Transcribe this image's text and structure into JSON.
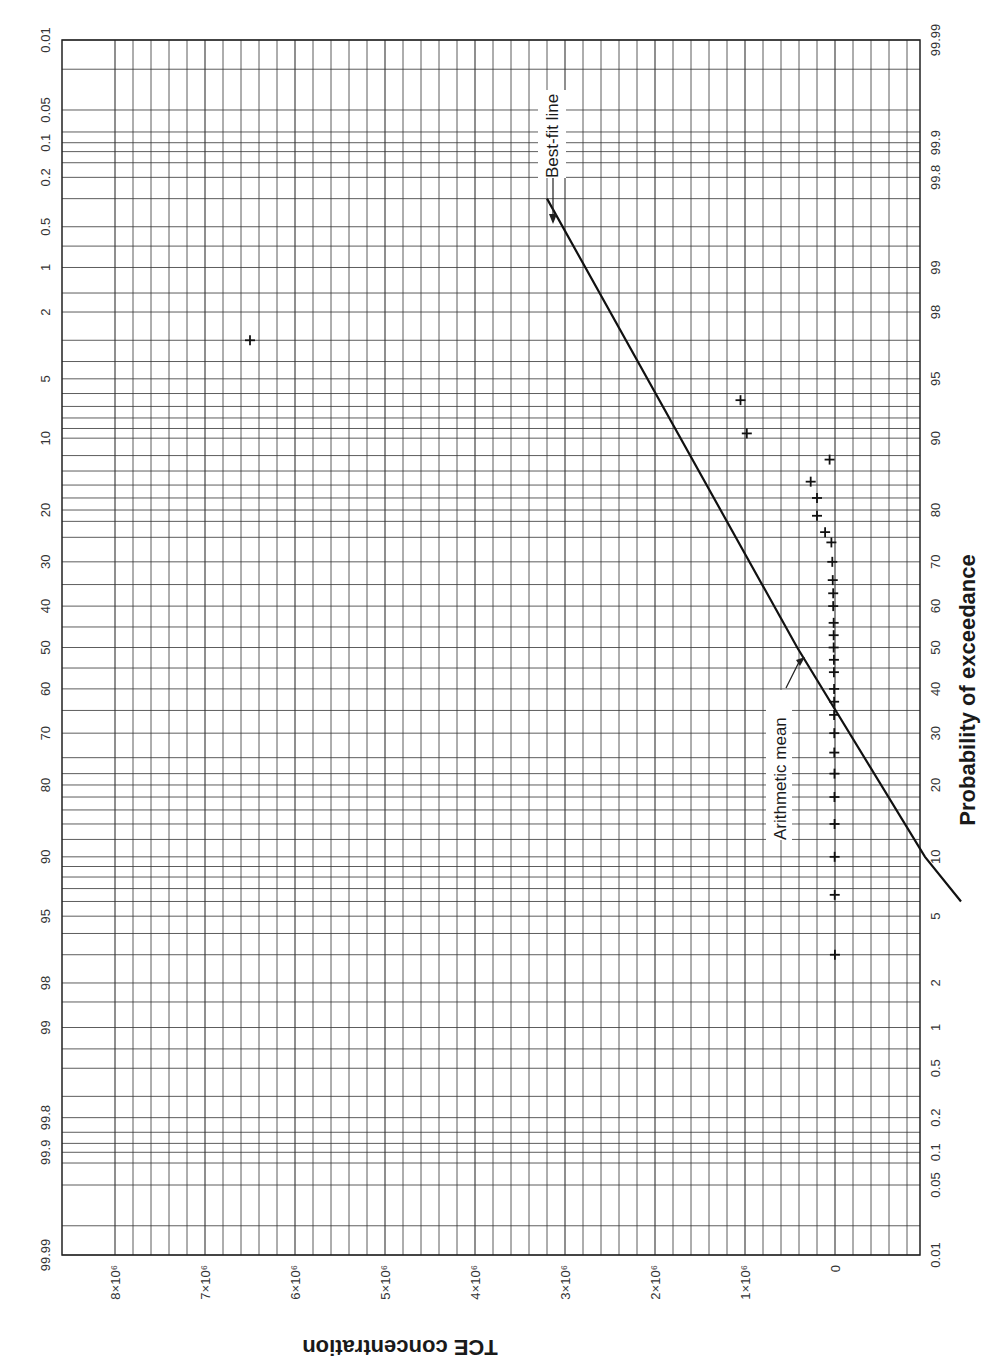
{
  "chart_data": {
    "type": "scatter",
    "subtype": "normal probability plot (rotated 90° on page)",
    "xlabel": "TCE concentration",
    "ylabel": "Probability of exceedance",
    "concentration_ticks": [
      "8×10⁶",
      "7×10⁶",
      "6×10⁶",
      "5×10⁶",
      "4×10⁶",
      "3×10⁶",
      "2×10⁶",
      "1×10⁶",
      "0"
    ],
    "concentration_tick_values": [
      8000000,
      7000000,
      6000000,
      5000000,
      4000000,
      3000000,
      2000000,
      1000000,
      0
    ],
    "probability_ticks_right": [
      "0.01",
      "5",
      "10",
      "20",
      "30",
      "40",
      "50",
      "60",
      "70",
      "80",
      "90",
      "95",
      "98",
      "99",
      "99.8",
      "99.9",
      "99.99"
    ],
    "probability_ticks_right_full": [
      "99.99",
      "99.9",
      "99.8",
      "99",
      "98",
      "95",
      "90",
      "80",
      "70",
      "60",
      "50",
      "40",
      "30",
      "20",
      "10",
      "5",
      "2",
      "1",
      "0.5",
      "0.2",
      "0.1",
      "0.05",
      "0.01"
    ],
    "probability_ticks_left": [
      "0.01",
      "0.05",
      "0.1",
      "0.2",
      "0.5",
      "1",
      "2",
      "5",
      "10",
      "20",
      "30",
      "40",
      "50",
      "60",
      "70",
      "80",
      "90",
      "95",
      "98",
      "99",
      "99.8",
      "99.9",
      "99.99"
    ],
    "grid": true,
    "series": [
      {
        "name": "TCE observations",
        "marker": "+",
        "points": [
          {
            "exceedance_pct": 97.0,
            "concentration": 6500000
          },
          {
            "exceedance_pct": 93.5,
            "concentration": 1050000
          },
          {
            "exceedance_pct": 90.5,
            "concentration": 980000
          },
          {
            "exceedance_pct": 87.5,
            "concentration": 60000
          },
          {
            "exceedance_pct": 84.5,
            "concentration": 270000
          },
          {
            "exceedance_pct": 82.0,
            "concentration": 200000
          },
          {
            "exceedance_pct": 79.0,
            "concentration": 200000
          },
          {
            "exceedance_pct": 76.0,
            "concentration": 110000
          },
          {
            "exceedance_pct": 74.0,
            "concentration": 40000
          },
          {
            "exceedance_pct": 70.0,
            "concentration": 30000
          },
          {
            "exceedance_pct": 66.0,
            "concentration": 25000
          },
          {
            "exceedance_pct": 63.0,
            "concentration": 20000
          },
          {
            "exceedance_pct": 60.0,
            "concentration": 20000
          },
          {
            "exceedance_pct": 56.0,
            "concentration": 15000
          },
          {
            "exceedance_pct": 53.0,
            "concentration": 15000
          },
          {
            "exceedance_pct": 50.0,
            "concentration": 15000
          },
          {
            "exceedance_pct": 47.0,
            "concentration": 12000
          },
          {
            "exceedance_pct": 44.0,
            "concentration": 12000
          },
          {
            "exceedance_pct": 40.0,
            "concentration": 10000
          },
          {
            "exceedance_pct": 37.0,
            "concentration": 10000
          },
          {
            "exceedance_pct": 34.0,
            "concentration": 10000
          },
          {
            "exceedance_pct": 30.0,
            "concentration": 8000
          },
          {
            "exceedance_pct": 26.0,
            "concentration": 8000
          },
          {
            "exceedance_pct": 22.0,
            "concentration": 6000
          },
          {
            "exceedance_pct": 18.0,
            "concentration": 6000
          },
          {
            "exceedance_pct": 14.0,
            "concentration": 5000
          },
          {
            "exceedance_pct": 10.0,
            "concentration": 4000
          },
          {
            "exceedance_pct": 6.5,
            "concentration": 3000
          },
          {
            "exceedance_pct": 3.0,
            "concentration": 1000
          }
        ]
      },
      {
        "name": "Best-fit line",
        "type": "line",
        "points": [
          {
            "exceedance_pct": 99.7,
            "concentration": 3200000
          },
          {
            "exceedance_pct": 50.0,
            "concentration": 420000
          },
          {
            "exceedance_pct": 10.0,
            "concentration": -1000000
          },
          {
            "exceedance_pct": 6.0,
            "concentration": -1400000
          }
        ]
      }
    ],
    "annotations": [
      {
        "text": "Best-fit line",
        "target": {
          "exceedance_pct": 99.5,
          "concentration": 2950000
        }
      },
      {
        "text": "Arithmetic mean",
        "target": {
          "exceedance_pct": 50.0,
          "concentration": 420000
        }
      }
    ]
  },
  "labels": {
    "x_title": "TCE concentration",
    "y_title": "Probability of exceedance",
    "best_fit": "Best-fit line",
    "mean": "Arithmetic mean"
  }
}
